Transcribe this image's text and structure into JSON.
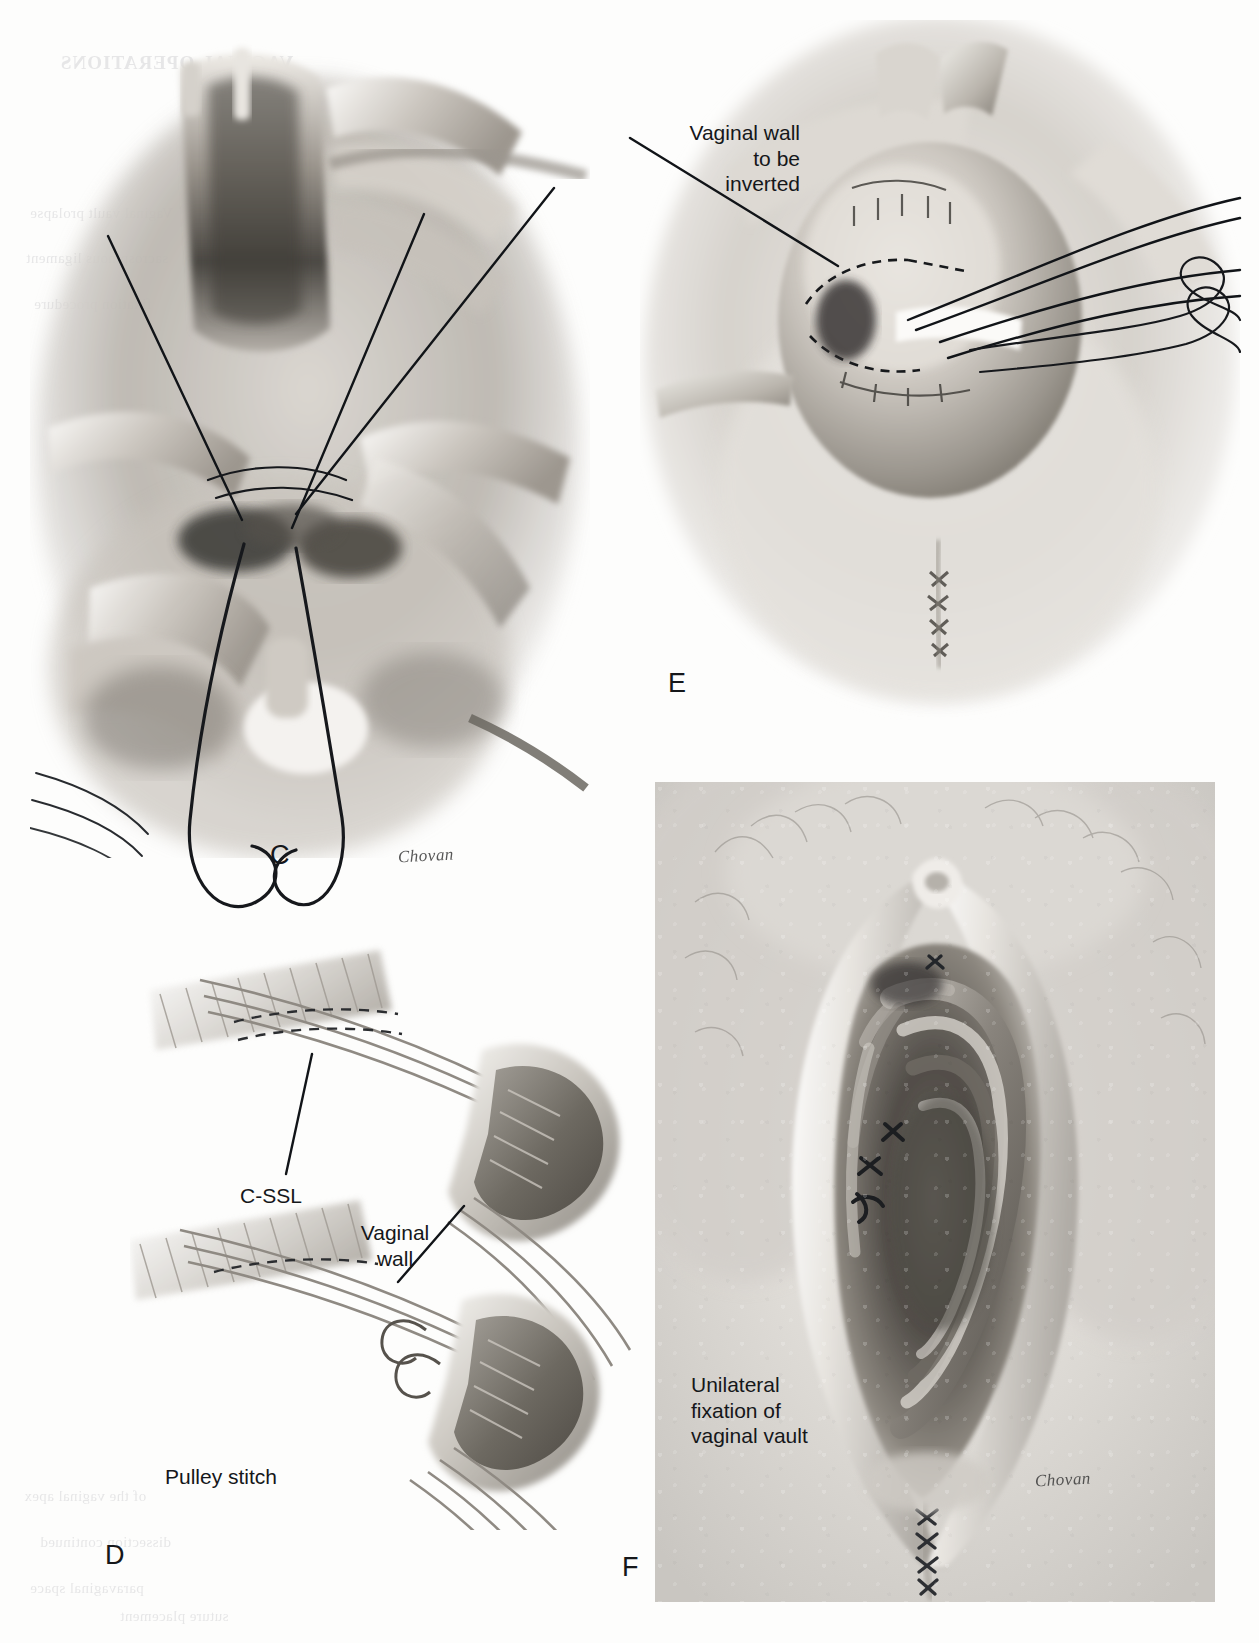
{
  "figure": {
    "kind": "surgical-atlas-illustration",
    "background_color": "#fdfdfc",
    "ink_color": "#15171a"
  },
  "panels": [
    {
      "id": "C",
      "letter": "C",
      "signature": "Chovan",
      "labels": []
    },
    {
      "id": "D",
      "letter": "D",
      "signature": "",
      "labels": [
        {
          "name": "c-ssl",
          "text": "C-SSL"
        },
        {
          "name": "vaginal-wall",
          "text": "Vaginal\nwall"
        },
        {
          "name": "pulley-stitch",
          "text": "Pulley stitch"
        }
      ]
    },
    {
      "id": "E",
      "letter": "E",
      "signature": "",
      "labels": [
        {
          "name": "vaginal-wall-to-be-inverted",
          "text": "Vaginal wall\nto be\ninverted"
        }
      ]
    },
    {
      "id": "F",
      "letter": "F",
      "signature": "Chovan",
      "labels": [
        {
          "name": "unilateral-fixation",
          "text": "Unilateral\nfixation of\nvaginal vault"
        }
      ]
    }
  ],
  "labels": {
    "vaginal_wall_to_be_inverted": "Vaginal wall\nto be\ninverted",
    "c_ssl": "C-SSL",
    "vaginal_wall": "Vaginal\nwall",
    "pulley_stitch": "Pulley stitch",
    "unilateral_fixation_of_vaginal_vault": "Unilateral\nfixation of\nvaginal vault"
  },
  "panel_letters": {
    "c": "C",
    "d": "D",
    "e": "E",
    "f": "F"
  },
  "signatures": {
    "panel_c": "Chovan",
    "panel_f": "Chovan"
  },
  "bleed_through": {
    "heading": "VAGINAL OPERATIONS",
    "line1": "Vaginal vault prolapse",
    "line2": "sacrospinous ligament",
    "line3": "fixation procedure",
    "line4": "of the vaginal apex",
    "line5": "dissection continued",
    "line6": "paravaginal space",
    "line7": "suture placement"
  }
}
